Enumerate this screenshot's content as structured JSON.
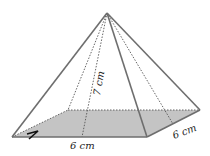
{
  "diagram": {
    "type": "square pyramid",
    "labels": {
      "height": "7 cm",
      "base_front": "6 cm",
      "base_side": "6 cm"
    },
    "colors": {
      "edge": "#6e6e6e",
      "base_fill": "#c4c4c4",
      "hidden_edge": "#555555",
      "text": "#222222"
    }
  }
}
